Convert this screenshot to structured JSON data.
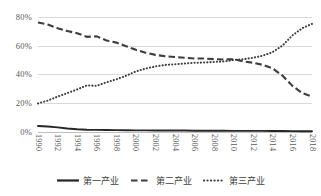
{
  "chart_data": {
    "type": "line",
    "title": "",
    "xlabel": "",
    "ylabel": "",
    "ylim": [
      0,
      80
    ],
    "ytick_values": [
      0,
      20,
      40,
      60,
      80
    ],
    "ytick_labels": [
      "0%",
      "20%",
      "40%",
      "60%",
      "80%"
    ],
    "grid": true,
    "legend_position": "bottom",
    "xlim": [
      1990,
      2018
    ],
    "x": [
      1990,
      1991,
      1992,
      1993,
      1994,
      1995,
      1996,
      1997,
      1998,
      1999,
      2000,
      2001,
      2002,
      2003,
      2004,
      2005,
      2006,
      2007,
      2008,
      2009,
      2010,
      2011,
      2012,
      2013,
      2014,
      2015,
      2016,
      2017,
      2018
    ],
    "xtick_labels": [
      "1990",
      "1992",
      "1994",
      "1996",
      "1998",
      "2000",
      "2002",
      "2004",
      "2006",
      "2008",
      "2010",
      "2012",
      "2014",
      "2016",
      "2018"
    ],
    "series": [
      {
        "name": "第一产业",
        "style": "solid",
        "color": "#262626",
        "values": [
          4.2,
          3.8,
          3.2,
          2.4,
          1.9,
          1.6,
          1.5,
          1.4,
          1.3,
          1.2,
          1.1,
          1.1,
          1.0,
          1.0,
          1.0,
          1.0,
          0.9,
          0.9,
          0.9,
          0.9,
          0.8,
          0.8,
          0.8,
          0.8,
          0.7,
          0.7,
          0.6,
          0.5,
          0.5
        ]
      },
      {
        "name": "第二产业",
        "style": "dashed",
        "color": "#3d3d3d",
        "values": [
          76.0,
          74.5,
          72.0,
          70.0,
          68.5,
          66.0,
          66.3,
          63.5,
          62.0,
          59.5,
          57.0,
          55.0,
          53.5,
          52.5,
          52.0,
          51.5,
          51.0,
          51.0,
          50.5,
          50.3,
          50.5,
          49.0,
          48.0,
          46.5,
          44.0,
          39.0,
          32.0,
          27.0,
          24.5
        ]
      },
      {
        "name": "第三产业",
        "style": "dotted",
        "color": "#3d3d3d",
        "values": [
          19.8,
          21.8,
          24.5,
          27.0,
          29.5,
          32.3,
          32.0,
          34.5,
          36.5,
          39.0,
          42.0,
          44.0,
          45.5,
          46.5,
          47.0,
          47.5,
          48.0,
          48.2,
          48.6,
          48.9,
          50.0,
          50.5,
          51.5,
          53.0,
          55.5,
          60.0,
          67.0,
          72.0,
          75.0
        ]
      }
    ]
  },
  "legend": {
    "items": [
      {
        "label": "第一产业",
        "style": "solid"
      },
      {
        "label": "第二产业",
        "style": "dashed"
      },
      {
        "label": "第三产业",
        "style": "dotted"
      }
    ]
  }
}
